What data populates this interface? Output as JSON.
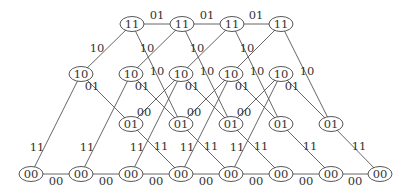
{
  "diagram": {
    "type": "trellis",
    "node_rx": 12,
    "node_ry": 7.5,
    "colors": {
      "edge": "#555555",
      "node_stroke": "#444444",
      "text": "#333333",
      "background": "#ffffff"
    },
    "rows": [
      {
        "state": "11",
        "y": 24,
        "xs": [
          132,
          182,
          232,
          281
        ]
      },
      {
        "state": "10",
        "y": 74,
        "xs": [
          81,
          131,
          181,
          231,
          281
        ]
      },
      {
        "state": "01",
        "y": 124,
        "xs": [
          131,
          181,
          231,
          281,
          331
        ]
      },
      {
        "state": "00",
        "y": 174,
        "xs": [
          31,
          81,
          131,
          181,
          231,
          281,
          331,
          380
        ]
      }
    ],
    "edges": [
      {
        "from": [
          31,
          174
        ],
        "to": [
          81,
          174
        ],
        "label": "00",
        "lx": 56,
        "ly": 185
      },
      {
        "from": [
          81,
          174
        ],
        "to": [
          131,
          174
        ],
        "label": "00",
        "lx": 106,
        "ly": 185
      },
      {
        "from": [
          131,
          174
        ],
        "to": [
          181,
          174
        ],
        "label": "00",
        "lx": 156,
        "ly": 185
      },
      {
        "from": [
          181,
          174
        ],
        "to": [
          231,
          174
        ],
        "label": "00",
        "lx": 206,
        "ly": 185
      },
      {
        "from": [
          231,
          174
        ],
        "to": [
          281,
          174
        ],
        "label": "00",
        "lx": 256,
        "ly": 185
      },
      {
        "from": [
          281,
          174
        ],
        "to": [
          331,
          174
        ],
        "label": "00",
        "lx": 306,
        "ly": 185
      },
      {
        "from": [
          331,
          174
        ],
        "to": [
          380,
          174
        ],
        "label": "00",
        "lx": 355,
        "ly": 185
      },
      {
        "from": [
          31,
          174
        ],
        "to": [
          81,
          74
        ],
        "label": "11",
        "lx": 37,
        "ly": 151
      },
      {
        "from": [
          81,
          174
        ],
        "to": [
          131,
          74
        ],
        "label": "11",
        "lx": 87,
        "ly": 151
      },
      {
        "from": [
          131,
          174
        ],
        "to": [
          181,
          74
        ],
        "label": "11",
        "lx": 137,
        "ly": 151
      },
      {
        "from": [
          181,
          174
        ],
        "to": [
          231,
          74
        ],
        "label": "11",
        "lx": 187,
        "ly": 151
      },
      {
        "from": [
          231,
          174
        ],
        "to": [
          281,
          74
        ],
        "label": "11",
        "lx": 237,
        "ly": 151
      },
      {
        "from": [
          131,
          124
        ],
        "to": [
          181,
          174
        ],
        "label": "11",
        "lx": 161,
        "ly": 150
      },
      {
        "from": [
          181,
          124
        ],
        "to": [
          231,
          174
        ],
        "label": "11",
        "lx": 211,
        "ly": 150
      },
      {
        "from": [
          231,
          124
        ],
        "to": [
          281,
          174
        ],
        "label": "11",
        "lx": 261,
        "ly": 150
      },
      {
        "from": [
          281,
          124
        ],
        "to": [
          331,
          174
        ],
        "label": "11",
        "lx": 310,
        "ly": 150
      },
      {
        "from": [
          331,
          124
        ],
        "to": [
          380,
          174
        ],
        "label": "11",
        "lx": 359,
        "ly": 150
      },
      {
        "from": [
          81,
          74
        ],
        "to": [
          131,
          124
        ],
        "label": "01",
        "lx": 92,
        "ly": 90
      },
      {
        "from": [
          131,
          74
        ],
        "to": [
          181,
          124
        ],
        "label": "01",
        "lx": 142,
        "ly": 90
      },
      {
        "from": [
          181,
          74
        ],
        "to": [
          231,
          124
        ],
        "label": "01",
        "lx": 192,
        "ly": 90
      },
      {
        "from": [
          231,
          74
        ],
        "to": [
          281,
          124
        ],
        "label": "01",
        "lx": 242,
        "ly": 90
      },
      {
        "from": [
          281,
          74
        ],
        "to": [
          331,
          124
        ],
        "label": "01",
        "lx": 292,
        "ly": 90
      },
      {
        "from": [
          131,
          124
        ],
        "to": [
          181,
          74
        ],
        "label": "00",
        "lx": 144,
        "ly": 116
      },
      {
        "from": [
          181,
          124
        ],
        "to": [
          231,
          74
        ],
        "label": "00",
        "lx": 194,
        "ly": 116
      },
      {
        "from": [
          231,
          124
        ],
        "to": [
          281,
          74
        ],
        "label": "00",
        "lx": 244,
        "ly": 116
      },
      {
        "from": [
          81,
          74
        ],
        "to": [
          132,
          24
        ],
        "label": "10",
        "lx": 97,
        "ly": 52
      },
      {
        "from": [
          131,
          74
        ],
        "to": [
          182,
          24
        ],
        "label": "10",
        "lx": 147,
        "ly": 52
      },
      {
        "from": [
          181,
          74
        ],
        "to": [
          232,
          24
        ],
        "label": "10",
        "lx": 197,
        "ly": 52
      },
      {
        "from": [
          231,
          74
        ],
        "to": [
          281,
          24
        ],
        "label": "10",
        "lx": 247,
        "ly": 52
      },
      {
        "from": [
          132,
          24
        ],
        "to": [
          181,
          124
        ],
        "label": "10",
        "lx": 157,
        "ly": 75
      },
      {
        "from": [
          182,
          24
        ],
        "to": [
          231,
          124
        ],
        "label": "10",
        "lx": 207,
        "ly": 75
      },
      {
        "from": [
          232,
          24
        ],
        "to": [
          281,
          124
        ],
        "label": "10",
        "lx": 257,
        "ly": 75
      },
      {
        "from": [
          281,
          24
        ],
        "to": [
          331,
          124
        ],
        "label": "10",
        "lx": 307,
        "ly": 75
      },
      {
        "from": [
          132,
          24
        ],
        "to": [
          182,
          24
        ],
        "label": "01",
        "lx": 157,
        "ly": 19
      },
      {
        "from": [
          182,
          24
        ],
        "to": [
          232,
          24
        ],
        "label": "01",
        "lx": 207,
        "ly": 19
      },
      {
        "from": [
          232,
          24
        ],
        "to": [
          281,
          24
        ],
        "label": "01",
        "lx": 256,
        "ly": 19
      }
    ]
  }
}
